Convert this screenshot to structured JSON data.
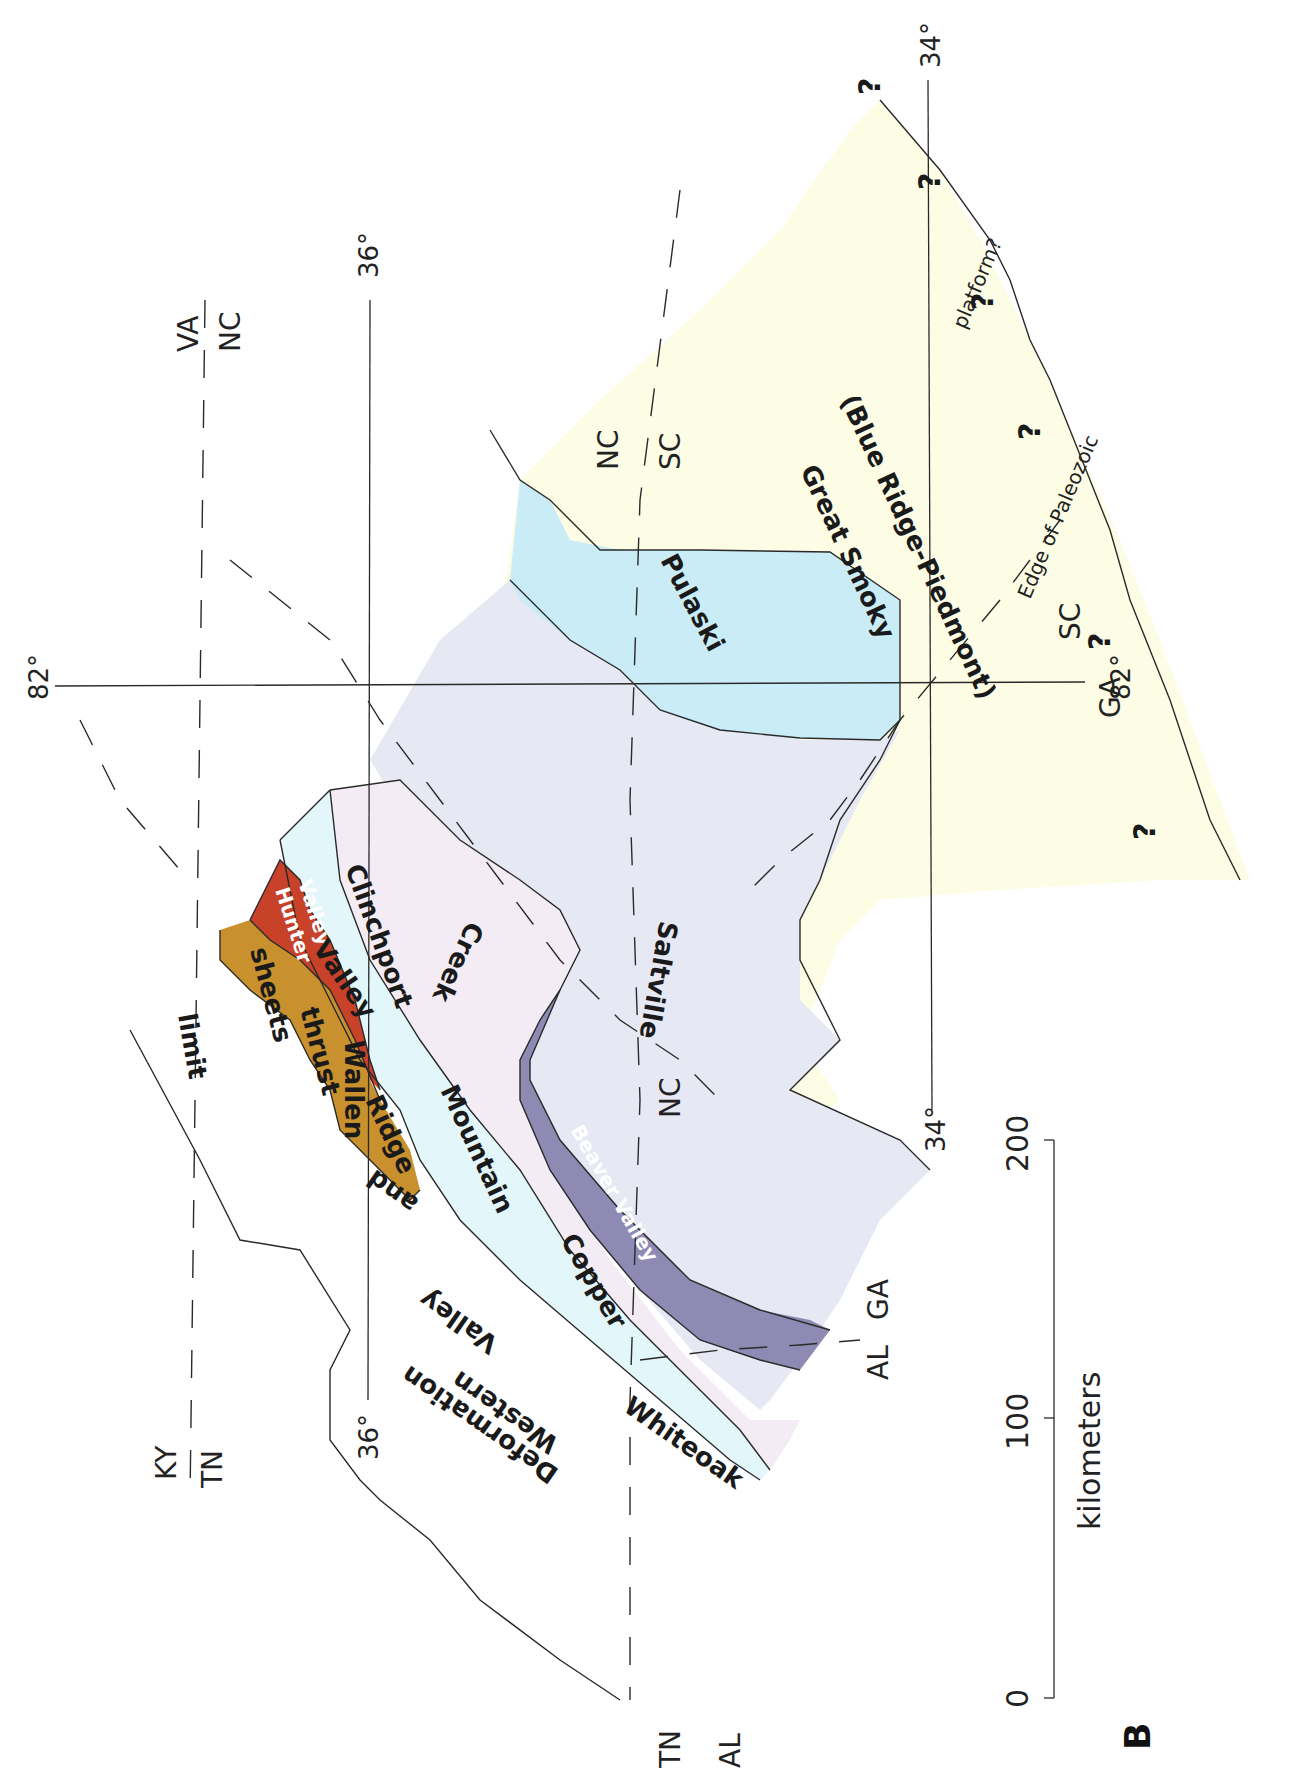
{
  "figure": {
    "panel_label": "B",
    "orientation": "rotated 90 degrees clockwise"
  },
  "colors": {
    "great_smoky": "#fdfde6",
    "pulaski": "#c9ecf7",
    "saltville": "#e6e8f4",
    "beaver_valley": "#8f8ab4",
    "copper_creek": "#f3ecf4",
    "whiteoak_clinchport": "#e3f6fa",
    "hunter_valley": "#c8422a",
    "wallen_valley": "#c9902e"
  },
  "thrust_sheets": [
    {
      "id": "great_smoky",
      "label_line1": "Great Smoky",
      "label_line2": "(Blue Ridge-Piedmont)"
    },
    {
      "id": "pulaski",
      "label": "Pulaski"
    },
    {
      "id": "saltville",
      "label": "Saltville"
    },
    {
      "id": "beaver_valley",
      "label": "Beaver Valley"
    },
    {
      "id": "copper_creek",
      "label_part1": "Copper",
      "label_part2": "Creek"
    },
    {
      "id": "whiteoak_mountain",
      "label_part1": "Whiteoak",
      "label_part2": "Mountain"
    },
    {
      "id": "clinchport",
      "label": "Clinchport"
    },
    {
      "id": "hunter_valley",
      "label_line1": "Hunter",
      "label_line2": "Valley"
    },
    {
      "id": "wallen_valley",
      "label_part1": "Wallen",
      "label_part2": "Valley"
    }
  ],
  "regional_label": {
    "words": [
      "Western",
      "Valley",
      "and",
      "Ridge",
      "thrust",
      "sheets"
    ],
    "limit_words": [
      "Deformation",
      "limit"
    ]
  },
  "state_labels": {
    "ky": "KY",
    "tn_top": "TN",
    "va": "VA",
    "nc_top": "NC",
    "nc_mid": "NC",
    "nc_east": "NC",
    "sc_east": "SC",
    "sc_south": "SC",
    "ga_south": "GA",
    "al_bottom": "AL",
    "ga_bottom": "GA",
    "tn_corner": "TN",
    "al_corner": "AL"
  },
  "graticule": {
    "lat36_top": "36°",
    "lat36_bottom": "36°",
    "lat34_top": "34°",
    "lat34_bottom": "34°",
    "lon82_left": "82°",
    "lon82_right": "82°"
  },
  "edge_label": {
    "line1": "Edge of Paleozoic",
    "line2": "platform?",
    "question_mark": "?"
  },
  "scale_bar": {
    "ticks": [
      "0",
      "100",
      "200"
    ],
    "unit": "kilometers"
  }
}
